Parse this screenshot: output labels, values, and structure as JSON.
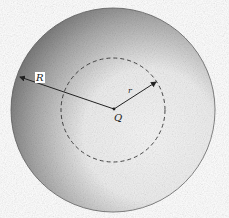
{
  "diagram": {
    "labels": {
      "outer_radius": "R",
      "inner_radius": "r",
      "center": "Q"
    },
    "colors": {
      "outline": "#555555",
      "shading_dark": "#6e6e6e",
      "background": "#ffffff"
    }
  }
}
